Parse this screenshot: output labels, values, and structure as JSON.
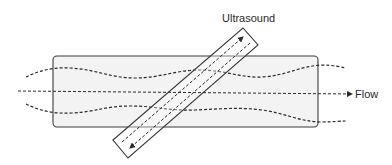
{
  "diagram": {
    "labels": {
      "probe": "Ultrasound",
      "flow": "Flow"
    },
    "colors": {
      "stroke": "#3a3a3a",
      "vessel_fill": "#f3f3f3",
      "background": "#ffffff"
    },
    "elements": [
      {
        "id": "vessel",
        "type": "rounded-rectangle"
      },
      {
        "id": "flow-axis",
        "type": "dashed-arrow",
        "direction": "right"
      },
      {
        "id": "upper-wall",
        "type": "dashed-wavy-line"
      },
      {
        "id": "lower-wall",
        "type": "dashed-wavy-line"
      },
      {
        "id": "ultrasound-probe",
        "type": "rotated-rectangle"
      },
      {
        "id": "beam-outgoing",
        "type": "dashed-arrow",
        "direction": "up-right"
      },
      {
        "id": "beam-returning",
        "type": "dashed-arrow",
        "direction": "down-left"
      }
    ]
  }
}
